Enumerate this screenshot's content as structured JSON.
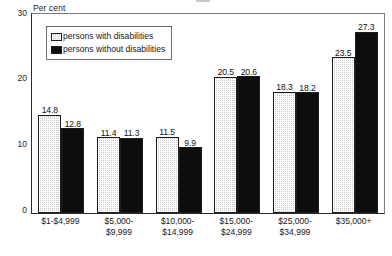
{
  "chart_data": {
    "type": "bar",
    "title": "",
    "xlabel": "",
    "ylabel": "Per cent",
    "ylim": [
      0,
      30
    ],
    "yticks": [
      0,
      10,
      20,
      30
    ],
    "grid": false,
    "legend_position": "top-left-inside",
    "categories": [
      "$1-$4,999",
      "$5,000-\n$9,999",
      "$10,000-\n$14,999",
      "$15,000-\n$24,999",
      "$25,000-\n$34,999",
      "$35,000+"
    ],
    "category_lines": [
      [
        "$1-$4,999",
        ""
      ],
      [
        "$5,000-",
        "$9,999"
      ],
      [
        "$10,000-",
        "$14,999"
      ],
      [
        "$15,000-",
        "$24,999"
      ],
      [
        "$25,000-",
        "$34,999"
      ],
      [
        "$35,000+",
        ""
      ]
    ],
    "series": [
      {
        "name": "persons with disabilities",
        "pattern": "dotted",
        "color": "#c9c9c9",
        "values": [
          14.8,
          11.4,
          11.5,
          20.5,
          18.3,
          23.5
        ]
      },
      {
        "name": "persons without disabilities",
        "pattern": "solid",
        "color": "#0d0d0d",
        "values": [
          12.8,
          11.3,
          9.9,
          20.6,
          18.2,
          27.3
        ]
      }
    ]
  },
  "axis": {
    "y_title": "Per cent",
    "tick_30": "30",
    "tick_20": "20",
    "tick_10": "10",
    "tick_0": "0"
  },
  "legend": {
    "items": [
      {
        "label": "persons with disabilities"
      },
      {
        "label": "persons without disabilities"
      }
    ]
  }
}
